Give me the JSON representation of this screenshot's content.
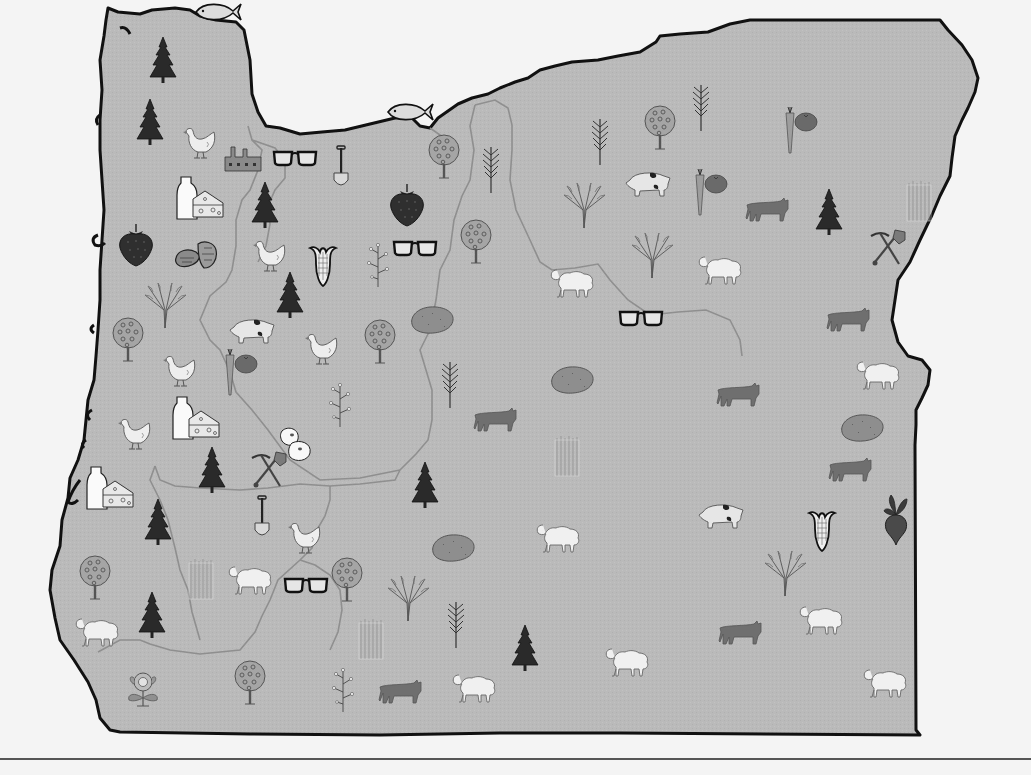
{
  "map": {
    "region": "Oregon",
    "style": {
      "land_fill": "#b9b9b9",
      "border_color": "#111111",
      "county_line_color": "#8f8f8f",
      "background": "#f4f4f4"
    }
  },
  "icons": [
    {
      "type": "fish",
      "x": 218,
      "y": 12
    },
    {
      "type": "fish",
      "x": 410,
      "y": 112
    },
    {
      "type": "tree",
      "x": 163,
      "y": 60
    },
    {
      "type": "tree",
      "x": 150,
      "y": 122
    },
    {
      "type": "chicken",
      "x": 200,
      "y": 142
    },
    {
      "type": "factory",
      "x": 243,
      "y": 158
    },
    {
      "type": "glasses",
      "x": 295,
      "y": 158
    },
    {
      "type": "shovel",
      "x": 341,
      "y": 168
    },
    {
      "type": "orchard",
      "x": 444,
      "y": 157
    },
    {
      "type": "wheat",
      "x": 491,
      "y": 170
    },
    {
      "type": "wheat",
      "x": 600,
      "y": 142
    },
    {
      "type": "orchard",
      "x": 660,
      "y": 128
    },
    {
      "type": "wheat",
      "x": 701,
      "y": 108
    },
    {
      "type": "vegetables",
      "x": 800,
      "y": 130
    },
    {
      "type": "milk-cheese",
      "x": 200,
      "y": 198
    },
    {
      "type": "tree",
      "x": 265,
      "y": 205
    },
    {
      "type": "strawberry",
      "x": 407,
      "y": 205
    },
    {
      "type": "pig",
      "x": 648,
      "y": 183
    },
    {
      "type": "vegetables",
      "x": 710,
      "y": 192
    },
    {
      "type": "wheat-bundle",
      "x": 584,
      "y": 205
    },
    {
      "type": "cattle",
      "x": 767,
      "y": 210
    },
    {
      "type": "tree",
      "x": 829,
      "y": 212
    },
    {
      "type": "asparagus",
      "x": 920,
      "y": 200
    },
    {
      "type": "strawberry",
      "x": 136,
      "y": 245
    },
    {
      "type": "hazelnut",
      "x": 198,
      "y": 255
    },
    {
      "type": "chicken",
      "x": 270,
      "y": 255
    },
    {
      "type": "corn",
      "x": 323,
      "y": 265
    },
    {
      "type": "herb",
      "x": 378,
      "y": 265
    },
    {
      "type": "glasses",
      "x": 415,
      "y": 248
    },
    {
      "type": "orchard",
      "x": 476,
      "y": 242
    },
    {
      "type": "wheat-bundle",
      "x": 652,
      "y": 255
    },
    {
      "type": "sheep",
      "x": 720,
      "y": 270
    },
    {
      "type": "mining",
      "x": 887,
      "y": 248
    },
    {
      "type": "sheep",
      "x": 572,
      "y": 283
    },
    {
      "type": "wheat-bundle",
      "x": 165,
      "y": 305
    },
    {
      "type": "tree",
      "x": 290,
      "y": 295
    },
    {
      "type": "potato",
      "x": 432,
      "y": 320
    },
    {
      "type": "glasses",
      "x": 641,
      "y": 318
    },
    {
      "type": "cattle",
      "x": 848,
      "y": 320
    },
    {
      "type": "orchard",
      "x": 128,
      "y": 340
    },
    {
      "type": "pig",
      "x": 252,
      "y": 330
    },
    {
      "type": "chicken",
      "x": 322,
      "y": 348
    },
    {
      "type": "orchard",
      "x": 380,
      "y": 342
    },
    {
      "type": "chicken",
      "x": 180,
      "y": 370
    },
    {
      "type": "vegetables",
      "x": 240,
      "y": 372
    },
    {
      "type": "potato",
      "x": 572,
      "y": 380
    },
    {
      "type": "wheat",
      "x": 450,
      "y": 385
    },
    {
      "type": "cattle",
      "x": 738,
      "y": 395
    },
    {
      "type": "sheep",
      "x": 878,
      "y": 375
    },
    {
      "type": "herb",
      "x": 340,
      "y": 405
    },
    {
      "type": "milk-cheese",
      "x": 196,
      "y": 418
    },
    {
      "type": "cattle",
      "x": 495,
      "y": 420
    },
    {
      "type": "chicken",
      "x": 135,
      "y": 433
    },
    {
      "type": "beans",
      "x": 296,
      "y": 445
    },
    {
      "type": "asparagus",
      "x": 568,
      "y": 455
    },
    {
      "type": "potato",
      "x": 862,
      "y": 428
    },
    {
      "type": "tree",
      "x": 212,
      "y": 470
    },
    {
      "type": "mining",
      "x": 268,
      "y": 470
    },
    {
      "type": "cattle",
      "x": 850,
      "y": 470
    },
    {
      "type": "milk-cheese",
      "x": 110,
      "y": 488
    },
    {
      "type": "tree",
      "x": 425,
      "y": 485
    },
    {
      "type": "tree",
      "x": 158,
      "y": 522
    },
    {
      "type": "shovel",
      "x": 262,
      "y": 518
    },
    {
      "type": "chicken",
      "x": 305,
      "y": 537
    },
    {
      "type": "sheep",
      "x": 558,
      "y": 538
    },
    {
      "type": "pig",
      "x": 721,
      "y": 515
    },
    {
      "type": "corn",
      "x": 822,
      "y": 530
    },
    {
      "type": "beet",
      "x": 896,
      "y": 520
    },
    {
      "type": "potato",
      "x": 453,
      "y": 548
    },
    {
      "type": "orchard",
      "x": 95,
      "y": 578
    },
    {
      "type": "asparagus",
      "x": 202,
      "y": 578
    },
    {
      "type": "sheep",
      "x": 250,
      "y": 580
    },
    {
      "type": "glasses",
      "x": 306,
      "y": 585
    },
    {
      "type": "orchard",
      "x": 347,
      "y": 580
    },
    {
      "type": "wheat-bundle",
      "x": 408,
      "y": 598
    },
    {
      "type": "wheat-bundle",
      "x": 785,
      "y": 573
    },
    {
      "type": "tree",
      "x": 152,
      "y": 615
    },
    {
      "type": "sheep",
      "x": 97,
      "y": 632
    },
    {
      "type": "wheat",
      "x": 456,
      "y": 625
    },
    {
      "type": "asparagus",
      "x": 372,
      "y": 638
    },
    {
      "type": "sheep",
      "x": 821,
      "y": 620
    },
    {
      "type": "cattle",
      "x": 740,
      "y": 633
    },
    {
      "type": "tree",
      "x": 525,
      "y": 648
    },
    {
      "type": "sheep",
      "x": 627,
      "y": 662
    },
    {
      "type": "flower",
      "x": 143,
      "y": 688
    },
    {
      "type": "orchard",
      "x": 250,
      "y": 683
    },
    {
      "type": "herb",
      "x": 343,
      "y": 690
    },
    {
      "type": "cattle",
      "x": 400,
      "y": 692
    },
    {
      "type": "sheep",
      "x": 474,
      "y": 688
    },
    {
      "type": "sheep",
      "x": 885,
      "y": 683
    }
  ]
}
